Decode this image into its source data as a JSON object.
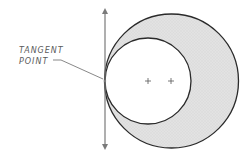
{
  "diagram": {
    "label": {
      "line1": "TANGENT",
      "line2": "POINT"
    },
    "colors": {
      "stroke": "#2a2a2a",
      "shade_fill": "#dcdcdc",
      "inner_fill": "#ffffff",
      "tangent_line": "#7a7a7a",
      "label": "#5a5a5a"
    },
    "outer_circle": {
      "cx": 171.5,
      "cy": 81,
      "r": 67
    },
    "inner_circle": {
      "cx": 148,
      "cy": 81,
      "r": 43
    },
    "tangent_line": {
      "x": 105,
      "y1": 10,
      "y2": 148
    },
    "tangent_point": {
      "x": 105,
      "y": 81
    },
    "center_marks": [
      {
        "name": "inner-center",
        "x": 148,
        "y": 81
      },
      {
        "name": "outer-center",
        "x": 171,
        "y": 81
      }
    ]
  }
}
